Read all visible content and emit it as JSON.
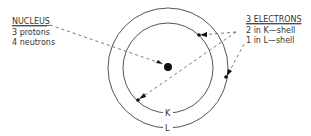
{
  "nucleus": {
    "title": "NUCLEUS",
    "lines": [
      "3 protons",
      "4 neutrons"
    ]
  },
  "electrons": {
    "title": "3 ELECTRONS",
    "lines": [
      "2 in K—shell",
      "1 in L—shell"
    ]
  },
  "shells": {
    "inner_label": "K",
    "outer_label": "L"
  },
  "colors": {
    "line": "#555555",
    "dot": "#111111"
  }
}
